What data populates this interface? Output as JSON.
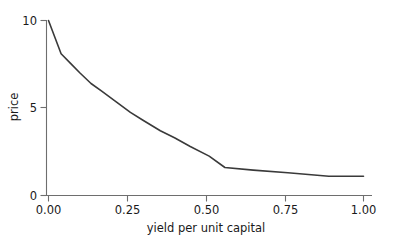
{
  "chart_data": {
    "type": "line",
    "title": "",
    "subtitle": "",
    "xlabel": "yield per unit capital",
    "ylabel": "price",
    "xlim": [
      0.0,
      1.0
    ],
    "ylim": [
      0.0,
      10.0
    ],
    "xticks": [
      0.0,
      0.25,
      0.5,
      0.75,
      1.0
    ],
    "xtick_labels": [
      "0.00",
      "0.25",
      "0.50",
      "0.75",
      "1.00"
    ],
    "yticks": [
      0,
      5,
      10
    ],
    "ytick_labels": [
      "0",
      "5",
      "10"
    ],
    "grid": false,
    "legend": null,
    "legend_position": "none",
    "annotations": [],
    "series": [
      {
        "name": "price curve",
        "color": "#3a3a3a",
        "line_width": 1.6,
        "x": [
          0.0,
          0.04,
          0.07,
          0.1,
          0.135,
          0.17,
          0.215,
          0.26,
          0.3,
          0.355,
          0.4,
          0.45,
          0.51,
          0.56,
          0.65,
          0.76,
          0.89,
          1.0
        ],
        "y": [
          10.0,
          8.1,
          7.55,
          7.0,
          6.4,
          5.95,
          5.35,
          4.75,
          4.3,
          3.7,
          3.3,
          2.8,
          2.25,
          1.6,
          1.45,
          1.3,
          1.1,
          1.1
        ]
      }
    ]
  },
  "axes": {
    "x_axis_name": "yield-per-unit-capital-axis",
    "y_axis_name": "price-axis"
  }
}
